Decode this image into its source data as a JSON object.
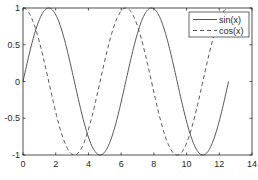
{
  "chart_data": {
    "type": "line",
    "title": "",
    "xlabel": "",
    "ylabel": "",
    "xlim": [
      0,
      14
    ],
    "ylim": [
      -1,
      1
    ],
    "xticks": [
      0,
      2,
      4,
      6,
      8,
      10,
      12,
      14
    ],
    "xtick_labels": [
      "0",
      "2",
      "4",
      "6",
      "8",
      "10",
      "12",
      "14"
    ],
    "yticks": [
      -1,
      -0.5,
      0,
      0.5,
      1
    ],
    "ytick_labels": [
      "-1",
      "-0.5",
      "0",
      "0.5",
      "1"
    ],
    "grid": false,
    "legend_position": "northeast",
    "x_range_plotted": [
      0,
      12.566
    ],
    "series": [
      {
        "name": "sin(x)",
        "function": "sin",
        "line_style": "solid",
        "color": "#555555",
        "x": [
          0,
          1.571,
          3.142,
          4.712,
          6.283,
          7.854,
          9.425,
          10.996,
          12.566
        ],
        "values": [
          0,
          1,
          0,
          -1,
          0,
          1,
          0,
          -1,
          0
        ]
      },
      {
        "name": "cos(x)",
        "function": "cos",
        "line_style": "dashed",
        "color": "#555555",
        "x": [
          0,
          1.571,
          3.142,
          4.712,
          6.283,
          7.854,
          9.425,
          10.996,
          12.566
        ],
        "values": [
          1,
          0,
          -1,
          0,
          1,
          0,
          -1,
          0,
          1
        ]
      }
    ]
  },
  "legend": {
    "items": [
      {
        "label": "sin(x)",
        "style": "solid"
      },
      {
        "label": "cos(x)",
        "style": "dashed"
      }
    ]
  },
  "colors": {
    "axes": "#262626",
    "line": "#555555",
    "background": "#ffffff"
  }
}
